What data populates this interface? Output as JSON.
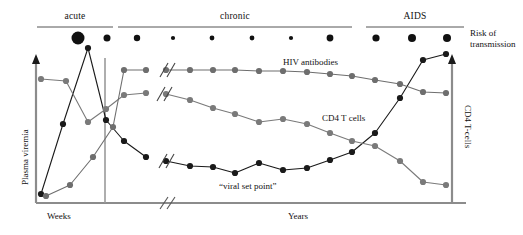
{
  "figure": {
    "phases": [
      {
        "label": "acute",
        "x": 37,
        "width": 76
      },
      {
        "label": "chronic",
        "x": 118,
        "width": 234
      },
      {
        "label": "AIDS",
        "x": 366,
        "width": 98
      }
    ],
    "axes": {
      "left_label": "Plasma viremia",
      "right_label": "CD4 T-cells",
      "x_left_label": "Weeks",
      "x_right_label": "Years"
    },
    "side_label": {
      "line1": "Risk of",
      "line2": "transmission"
    },
    "curve_labels": [
      {
        "text": "HIV antibodies",
        "x": 283,
        "y": 57
      },
      {
        "text": "CD4 T cells",
        "x": 322,
        "y": 113
      },
      {
        "text": "“viral set point”",
        "x": 219,
        "y": 181
      }
    ],
    "colors": {
      "viremia": "#1a1a1a",
      "cd4": "#7a7a7a",
      "antibodies": "#6e6e6e",
      "axis": "#8c8c8c",
      "rule": "#555555",
      "dot": "#111111"
    }
  },
  "chart_data": {
    "type": "line",
    "xlabel": "Weeks / Years since infection",
    "ylabel": "Plasma viremia",
    "y2label": "CD4 T-cells",
    "grid": false,
    "legend": "inline-annotations",
    "axis_breaks": [
      {
        "x": 165,
        "note": "time axis break between weeks and years"
      }
    ],
    "phase_spans": [
      {
        "name": "acute",
        "x_start": 37,
        "x_end": 113
      },
      {
        "name": "chronic",
        "x_start": 118,
        "x_end": 352
      },
      {
        "name": "AIDS",
        "x_start": 366,
        "x_end": 464
      }
    ],
    "series": [
      {
        "name": "Plasma viremia",
        "color": "#1a1a1a",
        "marker": "filled-circle",
        "points": [
          [
            41,
            194
          ],
          [
            63,
            124
          ],
          [
            88,
            48
          ],
          [
            106,
            120
          ],
          [
            124,
            141
          ],
          [
            146,
            157
          ],
          [
            166,
            161
          ],
          [
            190,
            166
          ],
          [
            213,
            167
          ],
          [
            235,
            173
          ],
          [
            259,
            163
          ],
          [
            283,
            170
          ],
          [
            307,
            168
          ],
          [
            330,
            160
          ],
          [
            352,
            152
          ],
          [
            375,
            133
          ],
          [
            400,
            98
          ],
          [
            423,
            60
          ],
          [
            446,
            54
          ]
        ]
      },
      {
        "name": "CD4 T cells",
        "color": "#7a7a7a",
        "marker": "filled-circle",
        "points": [
          [
            41,
            79
          ],
          [
            66,
            81
          ],
          [
            88,
            122
          ],
          [
            106,
            109
          ],
          [
            124,
            95
          ],
          [
            146,
            93
          ],
          [
            166,
            94
          ],
          [
            190,
            100
          ],
          [
            213,
            108
          ],
          [
            235,
            114
          ],
          [
            259,
            122
          ],
          [
            283,
            119
          ],
          [
            307,
            124
          ],
          [
            330,
            133
          ],
          [
            352,
            141
          ],
          [
            375,
            146
          ],
          [
            400,
            161
          ],
          [
            423,
            182
          ],
          [
            446,
            185
          ]
        ]
      },
      {
        "name": "HIV antibodies",
        "color": "#6e6e6e",
        "marker": "filled-circle",
        "points": [
          [
            46,
            196
          ],
          [
            70,
            185
          ],
          [
            93,
            157
          ],
          [
            113,
            127
          ],
          [
            124,
            70
          ],
          [
            146,
            70
          ],
          [
            166,
            70
          ],
          [
            190,
            70
          ],
          [
            213,
            70
          ],
          [
            235,
            70
          ],
          [
            259,
            71
          ],
          [
            283,
            71
          ],
          [
            307,
            72
          ],
          [
            330,
            74
          ],
          [
            352,
            76
          ],
          [
            375,
            80
          ],
          [
            400,
            84
          ],
          [
            423,
            92
          ],
          [
            446,
            93
          ]
        ]
      }
    ],
    "transmission_risk_dots": [
      {
        "x": 78,
        "r": 6.5,
        "phase": "acute",
        "level": "very high"
      },
      {
        "x": 107,
        "r": 3.5,
        "phase": "acute",
        "level": "moderate"
      },
      {
        "x": 137,
        "r": 3.2,
        "phase": "chronic",
        "level": "moderate"
      },
      {
        "x": 173,
        "r": 2.1,
        "phase": "chronic",
        "level": "low"
      },
      {
        "x": 212,
        "r": 2.4,
        "phase": "chronic",
        "level": "low"
      },
      {
        "x": 252,
        "r": 2.4,
        "phase": "chronic",
        "level": "low"
      },
      {
        "x": 291,
        "r": 2.1,
        "phase": "chronic",
        "level": "low"
      },
      {
        "x": 330,
        "r": 3.4,
        "phase": "chronic",
        "level": "moderate"
      },
      {
        "x": 376,
        "r": 3.6,
        "phase": "AIDS",
        "level": "high"
      },
      {
        "x": 412,
        "r": 4.0,
        "phase": "AIDS",
        "level": "high"
      },
      {
        "x": 447,
        "r": 4.0,
        "phase": "AIDS",
        "level": "high"
      }
    ]
  }
}
